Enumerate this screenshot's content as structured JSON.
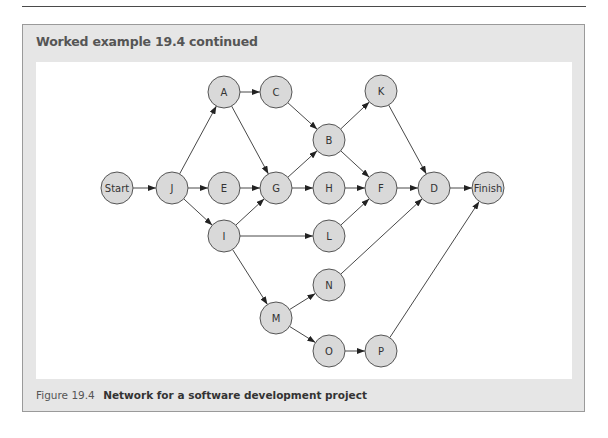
{
  "header": {
    "title": "Worked example 19.4 continued"
  },
  "caption": {
    "number": "Figure 19.4",
    "text": "Network for a software development project"
  },
  "colors": {
    "frame_bg": "#e6e6e6",
    "node_fill": "#d9d9d9",
    "node_stroke": "#555555",
    "edge": "#333333"
  },
  "diagram": {
    "type": "activity-network",
    "node_radius": 16,
    "nodes": [
      {
        "id": "Start",
        "label": "Start",
        "x": 117,
        "y": 188
      },
      {
        "id": "J",
        "label": "J",
        "x": 172,
        "y": 188
      },
      {
        "id": "A",
        "label": "A",
        "x": 224,
        "y": 92
      },
      {
        "id": "E",
        "label": "E",
        "x": 224,
        "y": 188
      },
      {
        "id": "I",
        "label": "I",
        "x": 224,
        "y": 236
      },
      {
        "id": "C",
        "label": "C",
        "x": 276,
        "y": 92
      },
      {
        "id": "G",
        "label": "G",
        "x": 276,
        "y": 188
      },
      {
        "id": "M",
        "label": "M",
        "x": 276,
        "y": 318
      },
      {
        "id": "B",
        "label": "B",
        "x": 329,
        "y": 140
      },
      {
        "id": "H",
        "label": "H",
        "x": 329,
        "y": 188
      },
      {
        "id": "L",
        "label": "L",
        "x": 329,
        "y": 236
      },
      {
        "id": "N",
        "label": "N",
        "x": 329,
        "y": 285
      },
      {
        "id": "O",
        "label": "O",
        "x": 329,
        "y": 351
      },
      {
        "id": "K",
        "label": "K",
        "x": 381,
        "y": 91
      },
      {
        "id": "F",
        "label": "F",
        "x": 381,
        "y": 188
      },
      {
        "id": "P",
        "label": "P",
        "x": 381,
        "y": 351
      },
      {
        "id": "D",
        "label": "D",
        "x": 434,
        "y": 188
      },
      {
        "id": "Finish",
        "label": "Finish",
        "x": 488,
        "y": 188
      }
    ],
    "edges": [
      [
        "Start",
        "J"
      ],
      [
        "J",
        "A"
      ],
      [
        "J",
        "E"
      ],
      [
        "J",
        "I"
      ],
      [
        "A",
        "C"
      ],
      [
        "A",
        "G"
      ],
      [
        "E",
        "G"
      ],
      [
        "I",
        "G"
      ],
      [
        "I",
        "L"
      ],
      [
        "I",
        "M"
      ],
      [
        "C",
        "B"
      ],
      [
        "G",
        "B"
      ],
      [
        "G",
        "H"
      ],
      [
        "B",
        "K"
      ],
      [
        "B",
        "F"
      ],
      [
        "H",
        "F"
      ],
      [
        "L",
        "F"
      ],
      [
        "K",
        "D"
      ],
      [
        "F",
        "D"
      ],
      [
        "N",
        "D"
      ],
      [
        "M",
        "N"
      ],
      [
        "M",
        "O"
      ],
      [
        "O",
        "P"
      ],
      [
        "D",
        "Finish"
      ],
      [
        "P",
        "Finish"
      ]
    ]
  }
}
